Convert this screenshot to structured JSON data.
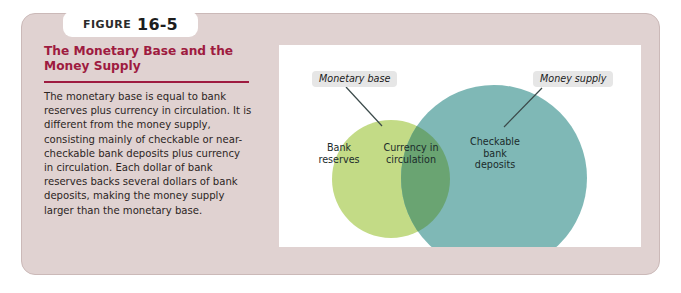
{
  "figure": {
    "tab_word": "FIGURE",
    "tab_number": "16-5",
    "title": "The Monetary Base and the Money Supply",
    "body": "The monetary base is equal to bank reserves plus currency in circulation. It is different from the money supply, consisting mainly of checkable or near-checkable bank deposits plus currency in circulation. Each dollar of bank reserves backs several dollars of bank deposits, making the money supply larger than the monetary base."
  },
  "colors": {
    "card_background": "#e0d2d1",
    "card_border": "#cbb9b8",
    "title_text": "#9e1b40",
    "panel_background": "#ffffff",
    "left_circle": "#c3db86",
    "right_circle": "#7fb8b6",
    "overlap": "#6aa472",
    "callout_background": "#e6e6e6",
    "leader_line": "#3b4a4a"
  },
  "diagram": {
    "type": "venn",
    "callouts": [
      {
        "name": "monetary-base",
        "text": "Monetary base"
      },
      {
        "name": "money-supply",
        "text": "Money supply"
      }
    ],
    "regions": [
      {
        "name": "bank-reserves",
        "label": "Bank\nreserves",
        "color": "#c3db86"
      },
      {
        "name": "currency-in-circulation",
        "label": "Currency in\ncirculation",
        "color": "#6aa472"
      },
      {
        "name": "checkable-bank-deposits",
        "label": "Checkable\nbank\ndeposits",
        "color": "#7fb8b6"
      }
    ]
  }
}
